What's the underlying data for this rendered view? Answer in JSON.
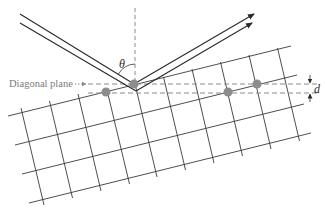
{
  "diagram": {
    "labels": {
      "diagonal_plane": "Diagonal plane",
      "theta": "θ",
      "spacing": "d"
    },
    "colors": {
      "grid": "#3a3a3a",
      "beam": "#2a2a2a",
      "dashed": "#8a8a8a",
      "atom": "#8c8c8c",
      "label": "#7a7a7a"
    },
    "lattice": {
      "rows": 4,
      "columns": 10,
      "highlighted_atoms": 4
    },
    "beams": {
      "incident": 2,
      "reflected": 2
    }
  }
}
